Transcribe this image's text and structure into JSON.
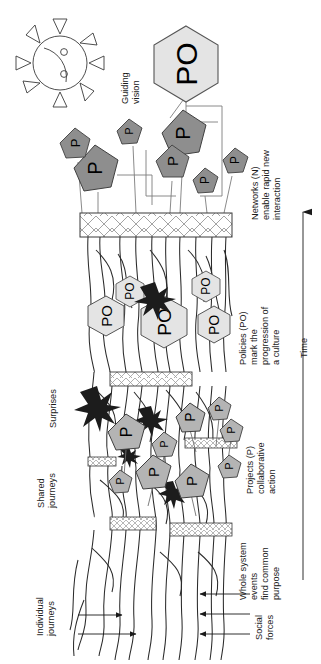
{
  "figure": {
    "orientation": "rotated-90-ccw",
    "background": "#ffffff"
  },
  "axis": {
    "time_label": "Time",
    "time_direction": "upward-arrow"
  },
  "annotations": {
    "guiding_vision": "Guiding\nvision",
    "guiding_vision_l1": "Guiding",
    "guiding_vision_l2": "vision",
    "networks_l1": "Networks (N)",
    "networks_l2": "enable rapid new",
    "networks_l3": "interaction",
    "policies_l1": "Policies (PO)",
    "policies_l2": "mark the",
    "policies_l3": "progression of",
    "policies_l4": "a culture",
    "projects_l1": "Projects (P)",
    "projects_l2": "collaborative",
    "projects_l3": "action",
    "whole_system_l1": "Whole system",
    "whole_system_l2": "events",
    "whole_system_l3": "find common",
    "whole_system_l4": "purpose",
    "surprises": "Surprises",
    "shared_journeys_l1": "Shared",
    "shared_journeys_l2": "journeys",
    "individual_journeys_l1": "Individual",
    "individual_journeys_l2": "journeys",
    "social_forces_l1": "Social",
    "social_forces_l2": "forces"
  },
  "legend_symbols": {
    "policy_symbol": "PO",
    "project_symbol": "P",
    "policy_shape": "hexagon",
    "project_shape": "pentagon",
    "event_shape": "cross-hatched-bar",
    "surprise_shape": "starburst",
    "vision_shape": "smiling-sun"
  },
  "colors": {
    "policy_fill": "#e2e2e2",
    "project_network_fill": "#8e8e8e",
    "project_lower_fill": "#b4b4b4",
    "surprise_fill": "#1c1c1c",
    "line": "#2b2b2b",
    "network_line": "#7d7d7d",
    "text": "#1a1a1a",
    "bar_fill": "#ffffff"
  },
  "nodes": {
    "policies": [
      {
        "label": "PO",
        "size": "xl",
        "x": 186,
        "y": 64,
        "role": "guiding-vision-policy"
      },
      {
        "label": "PO",
        "size": "l",
        "x": 164,
        "y": 322,
        "role": "policy"
      },
      {
        "label": "PO",
        "size": "m",
        "x": 106,
        "y": 316,
        "role": "policy"
      },
      {
        "label": "PO",
        "size": "m",
        "x": 130,
        "y": 291,
        "role": "policy"
      },
      {
        "label": "PO",
        "size": "m",
        "x": 206,
        "y": 286,
        "role": "policy"
      },
      {
        "label": "PO",
        "size": "m",
        "x": 214,
        "y": 325,
        "role": "policy"
      }
    ],
    "projects_network": [
      {
        "label": "P",
        "size": "l",
        "x": 95,
        "y": 168
      },
      {
        "label": "P",
        "size": "m",
        "x": 75,
        "y": 143
      },
      {
        "label": "P",
        "size": "s",
        "x": 129,
        "y": 131
      },
      {
        "label": "P",
        "size": "l",
        "x": 183,
        "y": 133
      },
      {
        "label": "P",
        "size": "m",
        "x": 172,
        "y": 161
      },
      {
        "label": "P",
        "size": "s",
        "x": 205,
        "y": 180
      },
      {
        "label": "P",
        "size": "s",
        "x": 235,
        "y": 160
      }
    ],
    "projects_lower": [
      {
        "label": "P",
        "size": "m",
        "x": 126,
        "y": 432
      },
      {
        "label": "P",
        "size": "s",
        "x": 164,
        "y": 444
      },
      {
        "label": "P",
        "size": "m",
        "x": 153,
        "y": 472
      },
      {
        "label": "P",
        "size": "s",
        "x": 120,
        "y": 481
      },
      {
        "label": "P",
        "size": "m",
        "x": 191,
        "y": 481
      },
      {
        "label": "P",
        "size": "m",
        "x": 190,
        "y": 417
      },
      {
        "label": "P",
        "size": "s",
        "x": 219,
        "y": 408
      },
      {
        "label": "P",
        "size": "s",
        "x": 231,
        "y": 430
      },
      {
        "label": "P",
        "size": "s",
        "x": 229,
        "y": 466
      }
    ],
    "surprises": [
      {
        "x": 97,
        "y": 408
      },
      {
        "x": 155,
        "y": 298
      },
      {
        "x": 151,
        "y": 422
      },
      {
        "x": 173,
        "y": 492
      },
      {
        "x": 129,
        "y": 455
      }
    ],
    "events": [
      {
        "x": 80,
        "y": 213,
        "w": 152,
        "h": 24,
        "kind": "major"
      },
      {
        "x": 110,
        "y": 372,
        "w": 82,
        "h": 14,
        "kind": "medium"
      },
      {
        "x": 185,
        "y": 438,
        "w": 52,
        "h": 10,
        "kind": "small"
      },
      {
        "x": 88,
        "y": 457,
        "w": 28,
        "h": 9,
        "kind": "small"
      },
      {
        "x": 110,
        "y": 517,
        "w": 46,
        "h": 13,
        "kind": "small"
      },
      {
        "x": 170,
        "y": 523,
        "w": 62,
        "h": 13,
        "kind": "small"
      }
    ]
  },
  "flow_arrows": {
    "individual_journeys_count": 2,
    "social_forces_count": 3
  }
}
